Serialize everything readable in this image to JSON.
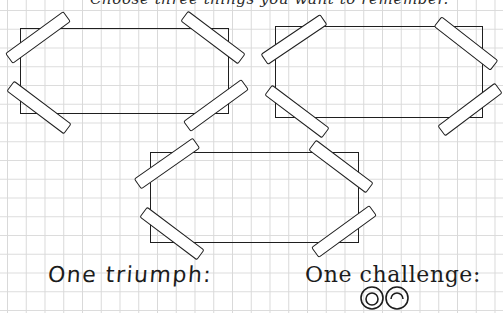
{
  "header": {
    "text": "Choose three things you want to remember."
  },
  "frames": [
    {
      "id": "photo-frame-1",
      "left": 20,
      "top": 28,
      "right": 229,
      "bottom": 114
    },
    {
      "id": "photo-frame-2",
      "left": 275,
      "top": 26,
      "right": 483,
      "bottom": 118
    },
    {
      "id": "photo-frame-3",
      "left": 150,
      "top": 152,
      "right": 359,
      "bottom": 243
    }
  ],
  "prompts": {
    "triumph": "One triumph:",
    "challenge": "One challenge:"
  },
  "icons": {
    "tape": "masking-tape-strip",
    "doodle": "spiral-eyes-doodle"
  },
  "colors": {
    "ink": "#1f1f1f",
    "grid": "#d9d9d9",
    "paper": "#ffffff"
  }
}
